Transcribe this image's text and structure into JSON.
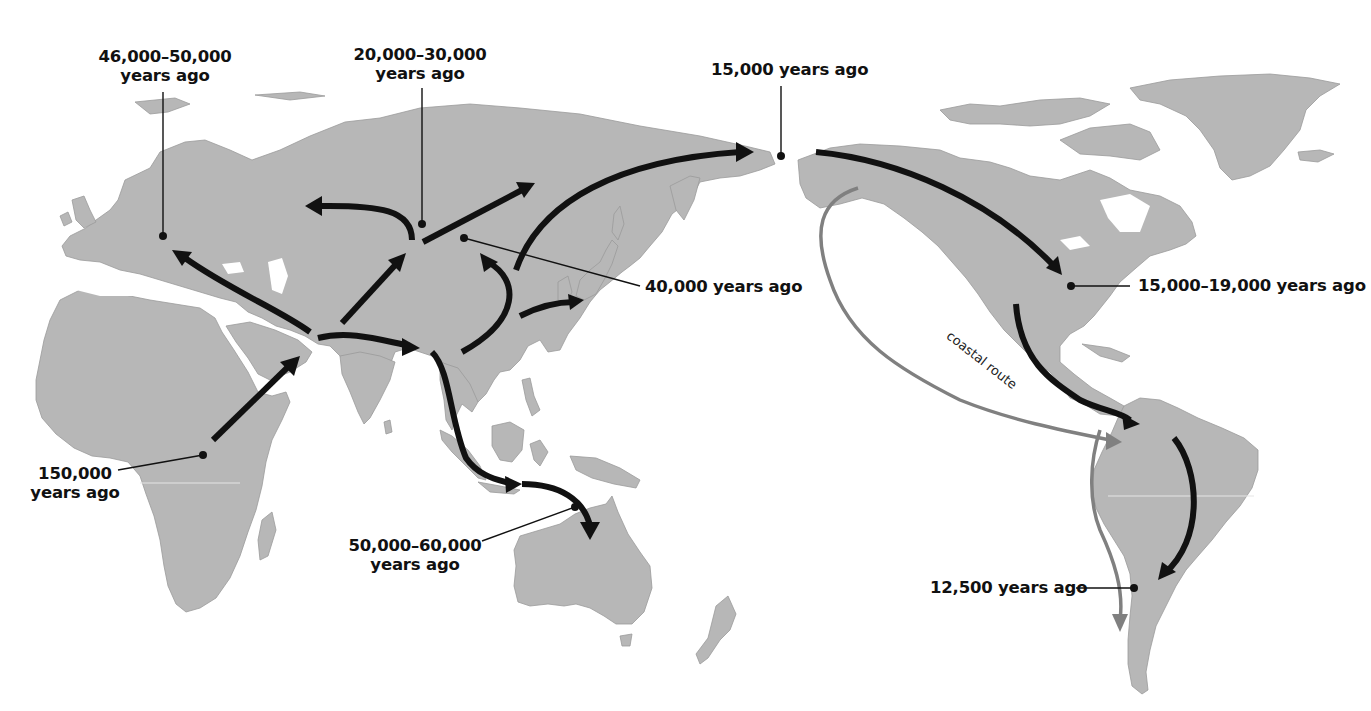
{
  "map": {
    "title": "Human migration routes out of Africa",
    "colors": {
      "land": "#b7b7b7",
      "water": "#ffffff",
      "route": "#111111",
      "coastal_route": "#808080"
    },
    "markers": [
      {
        "id": "africa",
        "label_line1": "150,000",
        "label_line2": "years ago",
        "dot": [
          203,
          455
        ]
      },
      {
        "id": "europe",
        "label_line1": "46,000–50,000",
        "label_line2": "years ago",
        "dot": [
          163,
          236
        ]
      },
      {
        "id": "central-asia",
        "label_line1": "20,000–30,000",
        "label_line2": "years ago",
        "dot": [
          422,
          224
        ]
      },
      {
        "id": "east-asia",
        "label": "40,000 years ago",
        "dot": [
          464,
          238
        ]
      },
      {
        "id": "beringia",
        "label": "15,000 years ago",
        "dot": [
          781,
          156
        ]
      },
      {
        "id": "north-america",
        "label": "15,000–19,000 years ago",
        "dot": [
          1071,
          286
        ]
      },
      {
        "id": "australia",
        "label_line1": "50,000–60,000",
        "label_line2": "years ago",
        "dot": [
          575,
          507
        ]
      },
      {
        "id": "south-america",
        "label": "12,500 years ago",
        "dot": [
          1134,
          588
        ]
      }
    ],
    "route_labels": {
      "coastal": "coastal route"
    }
  }
}
